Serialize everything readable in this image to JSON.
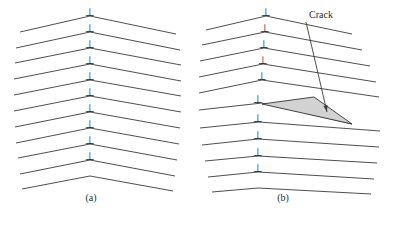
{
  "figure": {
    "background_color": "#ffffff",
    "line_color": "#3a3a3a",
    "crack_fill_color": "#d2d2d2",
    "crack_stroke_color": "#333333"
  },
  "panels": [
    {
      "id": "a",
      "caption": "(a)",
      "description": "Symmetric tilt boundary, vertical array of edge dislocations, no crack",
      "vertex_x": 90,
      "dislocation_symbol": "⊥",
      "dislocation_count": 10,
      "row_count": 11,
      "rows": [
        {
          "y": 16,
          "vertex_x": 90,
          "left_x": 20,
          "left_y": 32,
          "right_x": 176,
          "right_y": 34
        },
        {
          "y": 32,
          "vertex_x": 90,
          "left_x": 16,
          "left_y": 48,
          "right_x": 180,
          "right_y": 50
        },
        {
          "y": 48,
          "vertex_x": 90,
          "left_x": 15,
          "left_y": 63,
          "right_x": 181,
          "right_y": 65
        },
        {
          "y": 64,
          "vertex_x": 90,
          "left_x": 14,
          "left_y": 79,
          "right_x": 181,
          "right_y": 81
        },
        {
          "y": 80,
          "vertex_x": 90,
          "left_x": 14,
          "left_y": 95,
          "right_x": 181,
          "right_y": 96
        },
        {
          "y": 96,
          "vertex_x": 90,
          "left_x": 14,
          "left_y": 111,
          "right_x": 181,
          "right_y": 112
        },
        {
          "y": 112,
          "vertex_x": 90,
          "left_x": 15,
          "left_y": 127,
          "right_x": 180,
          "right_y": 128
        },
        {
          "y": 128,
          "vertex_x": 90,
          "left_x": 16,
          "left_y": 143,
          "right_x": 179,
          "right_y": 144
        },
        {
          "y": 144,
          "vertex_x": 90,
          "left_x": 18,
          "left_y": 158,
          "right_x": 177,
          "right_y": 160
        },
        {
          "y": 160,
          "vertex_x": 90,
          "left_x": 20,
          "left_y": 174,
          "right_x": 175,
          "right_y": 176
        },
        {
          "y": 176,
          "vertex_x": 90,
          "left_x": 22,
          "left_y": 189,
          "right_x": 173,
          "right_y": 191
        }
      ],
      "dislocation_positions": [
        {
          "x": 90,
          "y": 10
        },
        {
          "x": 90,
          "y": 26
        },
        {
          "x": 90,
          "y": 42
        },
        {
          "x": 90,
          "y": 58
        },
        {
          "x": 90,
          "y": 74
        },
        {
          "x": 90,
          "y": 90
        },
        {
          "x": 90,
          "y": 106
        },
        {
          "x": 90,
          "y": 122
        },
        {
          "x": 90,
          "y": 138
        },
        {
          "x": 90,
          "y": 154
        }
      ]
    },
    {
      "id": "b",
      "caption": "(b)",
      "description": "Tilt boundary with wedge-shaped crack opened along the boundary",
      "dislocation_symbol": "⊥",
      "dislocation_count": 10,
      "row_count": 11,
      "rows": [
        {
          "vertex_x": 266,
          "vertex_y": 16,
          "left_x": 206,
          "left_y": 30,
          "right_x": 352,
          "right_y": 34
        },
        {
          "vertex_x": 265,
          "vertex_y": 32,
          "left_x": 202,
          "left_y": 45,
          "right_x": 362,
          "right_y": 50
        },
        {
          "vertex_x": 264,
          "vertex_y": 48,
          "left_x": 200,
          "left_y": 61,
          "right_x": 370,
          "right_y": 66
        },
        {
          "vertex_x": 263,
          "vertex_y": 64,
          "left_x": 199,
          "left_y": 77,
          "right_x": 376,
          "right_y": 82
        },
        {
          "vertex_x": 262,
          "vertex_y": 80,
          "left_x": 199,
          "left_y": 93,
          "right_x": 379,
          "right_y": 97
        },
        {
          "vertex_x": 262,
          "vertex_y": 103,
          "left_x": 199,
          "left_y": 110,
          "right_x": 352,
          "right_y": 124
        },
        {
          "vertex_x": 259,
          "vertex_y": 122,
          "left_x": 200,
          "left_y": 128,
          "right_x": 380,
          "right_y": 131
        },
        {
          "vertex_x": 258,
          "vertex_y": 139,
          "left_x": 202,
          "left_y": 145,
          "right_x": 379,
          "right_y": 147
        },
        {
          "vertex_x": 258,
          "vertex_y": 156,
          "left_x": 205,
          "left_y": 161,
          "right_x": 377,
          "right_y": 163
        },
        {
          "vertex_x": 258,
          "vertex_y": 172,
          "left_x": 208,
          "left_y": 177,
          "right_x": 374,
          "right_y": 179
        },
        {
          "vertex_x": 258,
          "vertex_y": 188,
          "left_x": 212,
          "left_y": 192,
          "right_x": 371,
          "right_y": 194
        }
      ],
      "dislocation_positions": [
        {
          "x": 266,
          "y": 10
        },
        {
          "x": 265,
          "y": 26
        },
        {
          "x": 264,
          "y": 42
        },
        {
          "x": 263,
          "y": 58
        },
        {
          "x": 262,
          "y": 74
        },
        {
          "x": 258,
          "y": 97
        },
        {
          "x": 258,
          "y": 116
        },
        {
          "x": 258,
          "y": 133
        },
        {
          "x": 258,
          "y": 150
        },
        {
          "x": 258,
          "y": 166
        }
      ],
      "crack": {
        "label": "Crack",
        "fill": "#d2d2d2",
        "apex_x": 262,
        "apex_y": 104,
        "top_x": 314,
        "top_y": 97,
        "tip_x": 352,
        "tip_y": 124,
        "leader_from_x": 306,
        "leader_from_y": 22,
        "leader_to_x": 327,
        "leader_to_y": 112
      }
    }
  ]
}
